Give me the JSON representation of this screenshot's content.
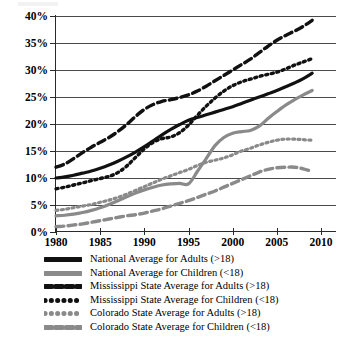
{
  "chart_data": {
    "type": "line",
    "title": "",
    "subtitle": "",
    "xlabel": "",
    "ylabel": "",
    "xlim": [
      1980,
      2010
    ],
    "ylim": [
      0,
      40
    ],
    "grid": true,
    "legend_position": "bottom",
    "x_ticks": [
      "1980",
      "1985",
      "1990",
      "1995",
      "2000",
      "2005",
      "2010"
    ],
    "x_tick_values": [
      1980,
      1985,
      1990,
      1995,
      2000,
      2005,
      2010
    ],
    "y_ticks": [
      "0%",
      "5%",
      "10%",
      "15%",
      "20%",
      "25%",
      "30%",
      "35%",
      "40%"
    ],
    "y_tick_values": [
      0,
      5,
      10,
      15,
      20,
      25,
      30,
      35,
      40
    ],
    "x": [
      1980,
      1981,
      1982,
      1983,
      1984,
      1985,
      1986,
      1987,
      1988,
      1989,
      1990,
      1991,
      1992,
      1993,
      1994,
      1995,
      1996,
      1997,
      1998,
      1999,
      2000,
      2001,
      2002,
      2003,
      2004,
      2005,
      2006,
      2007,
      2008,
      2009
    ],
    "series": [
      {
        "name": "National Average for Adults (>18)",
        "style": "solid",
        "color": "#111111",
        "width": 3.2,
        "values": [
          10.0,
          10.2,
          10.5,
          10.9,
          11.3,
          11.8,
          12.4,
          13.1,
          13.9,
          14.8,
          15.8,
          16.9,
          18.0,
          19.0,
          19.9,
          20.7,
          21.2,
          21.7,
          22.2,
          22.7,
          23.2,
          23.8,
          24.4,
          25.0,
          25.6,
          26.2,
          26.9,
          27.6,
          28.4,
          29.4
        ]
      },
      {
        "name": "National Average for Children (<18)",
        "style": "solid",
        "color": "#8a8a8a",
        "width": 3.2,
        "values": [
          3.0,
          3.1,
          3.3,
          3.6,
          4.0,
          4.5,
          5.1,
          5.8,
          6.5,
          7.2,
          7.8,
          8.3,
          8.7,
          8.9,
          9.0,
          8.9,
          11.2,
          13.6,
          16.0,
          17.5,
          18.3,
          18.6,
          18.8,
          19.6,
          21.0,
          22.3,
          23.5,
          24.5,
          25.4,
          26.2
        ]
      },
      {
        "name": "Mississippi State Average for Adults (>18)",
        "style": "dashed",
        "color": "#111111",
        "width": 3.4,
        "values": [
          12.0,
          12.6,
          13.6,
          14.7,
          15.7,
          16.6,
          17.5,
          18.6,
          19.9,
          21.4,
          22.7,
          23.6,
          24.2,
          24.5,
          24.9,
          25.4,
          26.1,
          27.0,
          28.0,
          29.0,
          30.0,
          31.0,
          32.0,
          33.2,
          34.4,
          35.5,
          36.4,
          37.2,
          38.1,
          39.2
        ]
      },
      {
        "name": "Mississippi State Average for Children (<18)",
        "style": "dotted",
        "color": "#111111",
        "width": 3.4,
        "values": [
          8.0,
          8.3,
          8.7,
          9.1,
          9.5,
          9.9,
          10.3,
          11.0,
          12.2,
          13.8,
          15.4,
          16.6,
          17.3,
          17.6,
          18.4,
          19.8,
          21.6,
          23.3,
          24.8,
          26.1,
          27.1,
          27.8,
          28.3,
          28.8,
          29.2,
          29.6,
          30.2,
          30.9,
          31.5,
          32.1
        ]
      },
      {
        "name": "Colorado State Average for Adults (>18)",
        "style": "dotted",
        "color": "#8a8a8a",
        "width": 3.2,
        "values": [
          4.0,
          4.2,
          4.5,
          4.8,
          5.1,
          5.5,
          5.9,
          6.4,
          7.0,
          7.7,
          8.4,
          9.1,
          9.8,
          10.4,
          11.0,
          11.6,
          12.3,
          12.9,
          13.3,
          13.7,
          14.3,
          15.0,
          15.5,
          16.1,
          16.6,
          17.0,
          17.2,
          17.2,
          17.1,
          17.0
        ]
      },
      {
        "name": "Colorado State Average for Children (<18)",
        "style": "dashed",
        "color": "#8a8a8a",
        "width": 3.4,
        "values": [
          1.0,
          1.1,
          1.3,
          1.5,
          1.8,
          2.1,
          2.4,
          2.7,
          3.0,
          3.2,
          3.5,
          3.9,
          4.3,
          4.8,
          5.3,
          5.8,
          6.4,
          7.0,
          7.6,
          8.3,
          9.0,
          9.7,
          10.4,
          11.1,
          11.6,
          11.9,
          12.0,
          12.0,
          11.7,
          11.2
        ]
      }
    ]
  },
  "legend": {
    "items": [
      {
        "label": "National Average for Adults (>18)",
        "swatch": "solid-black-line-swatch"
      },
      {
        "label": "National Average for Children (<18)",
        "swatch": "solid-gray-line-swatch"
      },
      {
        "label": "Mississippi State Average for Adults (>18)",
        "swatch": "dashed-black-line-swatch"
      },
      {
        "label": "Mississippi State Average for Children (<18)",
        "swatch": "dotted-black-line-swatch"
      },
      {
        "label": "Colorado State Average for Adults (>18)",
        "swatch": "dotted-gray-line-swatch"
      },
      {
        "label": "Colorado State Average for Children (<18)",
        "swatch": "dashed-gray-line-swatch"
      }
    ]
  }
}
